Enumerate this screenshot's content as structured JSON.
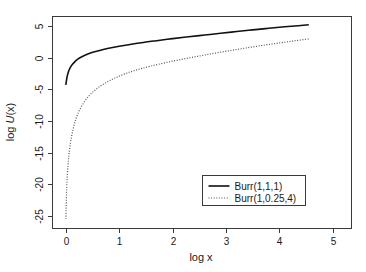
{
  "chart_data": {
    "type": "line",
    "title": "",
    "subtitle": "",
    "xlabel": "log x",
    "ylabel": "log U(x)",
    "xlim": [
      -0.25,
      5.35
    ],
    "ylim": [
      -27.0,
      6.5
    ],
    "xticks": [
      0,
      1,
      2,
      3,
      4,
      5
    ],
    "xtick_labels": [
      "0",
      "1",
      "2",
      "3",
      "4",
      "5"
    ],
    "yticks": [
      5,
      0,
      -5,
      -10,
      -15,
      -20,
      -25
    ],
    "ytick_labels": [
      "5",
      "0",
      "-5",
      "-10",
      "-15",
      "-20",
      "-25"
    ],
    "grid": false,
    "legend_position": "bottom-right",
    "series": [
      {
        "name": "Burr(1,1,1)",
        "style": "solid",
        "color": "#111111",
        "x": [
          0.0,
          0.02,
          0.05,
          0.08,
          0.12,
          0.17,
          0.23,
          0.3,
          0.4,
          0.52,
          0.65,
          0.8,
          1.0,
          1.2,
          1.45,
          1.7,
          2.0,
          2.3,
          2.6,
          2.9,
          3.2,
          3.5,
          3.8,
          4.1,
          4.35,
          4.55
        ],
        "y": [
          -4.3,
          -3.15,
          -2.2,
          -1.62,
          -1.1,
          -0.62,
          -0.2,
          0.15,
          0.52,
          0.88,
          1.18,
          1.47,
          1.8,
          2.08,
          2.4,
          2.68,
          3.0,
          3.29,
          3.57,
          3.85,
          4.12,
          4.39,
          4.64,
          4.88,
          5.05,
          5.2
        ]
      },
      {
        "name": "Burr(1,0.25,4)",
        "style": "dotted",
        "color": "#555555",
        "x": [
          0.0,
          0.01,
          0.02,
          0.04,
          0.06,
          0.09,
          0.13,
          0.18,
          0.25,
          0.34,
          0.45,
          0.58,
          0.74,
          0.92,
          1.12,
          1.35,
          1.6,
          1.9,
          2.2,
          2.5,
          2.8,
          3.1,
          3.4,
          3.7,
          4.0,
          4.28,
          4.55
        ],
        "y": [
          -25.5,
          -22.2,
          -19.7,
          -17.0,
          -15.2,
          -13.3,
          -11.5,
          -9.9,
          -8.4,
          -7.05,
          -5.9,
          -4.9,
          -4.0,
          -3.22,
          -2.52,
          -1.88,
          -1.32,
          -0.74,
          -0.22,
          0.26,
          0.72,
          1.15,
          1.56,
          1.95,
          2.32,
          2.65,
          2.96
        ]
      }
    ],
    "legend_entries": [
      {
        "label": "Burr(1,1,1)",
        "style": "solid",
        "color": "#111111"
      },
      {
        "label": "Burr(1,0.25,4)",
        "style": "dotted",
        "color": "#555555"
      }
    ]
  },
  "axes": {
    "x_title": "log x",
    "y_title_prefix": "log ",
    "y_title_italic": "U",
    "y_title_suffix": "(x)"
  },
  "colors": {
    "background": "#ffffff",
    "frame": "#3a3a3a",
    "text": "#1a1a1a",
    "series_solid": "#111111",
    "series_dotted": "#555555"
  }
}
